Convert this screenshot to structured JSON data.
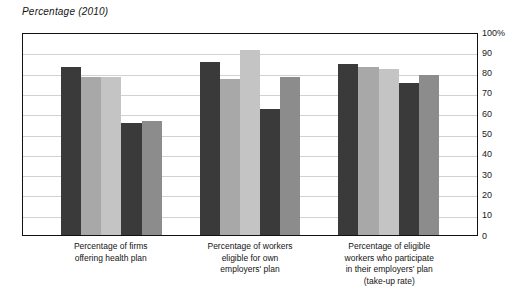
{
  "chart_data": {
    "type": "bar",
    "title": "Percentage (2010)",
    "xlabel": "",
    "ylabel": "Percentage (2010)",
    "ylim": [
      0,
      100
    ],
    "ytick_labels": [
      "100%",
      "90",
      "80",
      "70",
      "60",
      "50",
      "40",
      "30",
      "20",
      "10",
      "0"
    ],
    "ytick_values": [
      100,
      90,
      80,
      70,
      60,
      50,
      40,
      30,
      20,
      10,
      0
    ],
    "grid": true,
    "legend_position": "none",
    "categories": [
      "Percentage of firms offering health plan",
      "Percentage of workers eligible for own employers' plan",
      "Percentage of eligible workers who participate in their employers' plan (take-up rate)"
    ],
    "category_label_lines": [
      [
        "Percentage of firms",
        "offering health plan"
      ],
      [
        "Percentage of workers",
        "eligible for own",
        "employers' plan"
      ],
      [
        "Percentage of eligible",
        "workers who participate",
        "in their employers' plan",
        "(take-up rate)"
      ]
    ],
    "series": [
      {
        "name": "Series 1",
        "color": "#3a3a3a",
        "values": [
          83,
          85,
          84
        ]
      },
      {
        "name": "Series 2",
        "color": "#a8a8a8",
        "values": [
          78,
          77,
          83
        ]
      },
      {
        "name": "Series 3",
        "color": "#c4c4c4",
        "values": [
          78,
          91,
          82
        ]
      },
      {
        "name": "Series 4",
        "color": "#3a3a3a",
        "values": [
          55,
          62,
          75
        ]
      },
      {
        "name": "Series 5",
        "color": "#8c8c8c",
        "values": [
          56,
          78,
          79
        ]
      }
    ]
  },
  "colors": {
    "bar_dark": "#3a3a3a",
    "bar_light_gray": "#a8a8a8",
    "bar_lightest_gray": "#c4c4c4",
    "bar_mid_gray": "#8c8c8c",
    "gridline": "#d2d2d2",
    "frame": "#111111",
    "text": "#141414",
    "background": "#ffffff"
  }
}
